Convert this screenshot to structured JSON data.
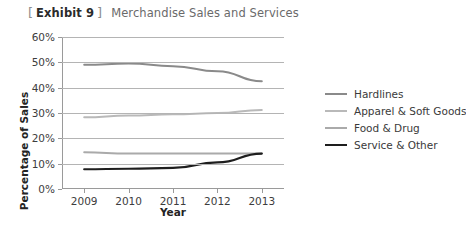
{
  "header": {
    "bracket_open": "[",
    "bracket_close": "]",
    "exhibit_label": "Exhibit 9",
    "title": "Merchandise Sales and Services"
  },
  "chart_data": {
    "type": "line",
    "title": "Merchandise Sales and Services",
    "xlabel": "Year",
    "ylabel": "Percentage of Sales",
    "categories": [
      "2009",
      "2010",
      "2011",
      "2012",
      "2013"
    ],
    "x": [
      2009,
      2010,
      2011,
      2012,
      2013
    ],
    "ylim": [
      0,
      60
    ],
    "yticks": [
      "0%",
      "10%",
      "20%",
      "30%",
      "40%",
      "50%",
      "60%"
    ],
    "ytick_values": [
      0,
      10,
      20,
      30,
      40,
      50,
      60
    ],
    "grid": true,
    "legend_position": "right",
    "series": [
      {
        "name": "Hardlines",
        "color": "#8a8a8a",
        "width": 2.0,
        "values": [
          49.0,
          49.5,
          48.5,
          46.5,
          42.5
        ]
      },
      {
        "name": "Apparel & Soft Goods",
        "color": "#b9b9b9",
        "width": 2.0,
        "values": [
          28.3,
          29.0,
          29.5,
          30.0,
          31.2
        ]
      },
      {
        "name": "Food & Drug",
        "color": "#aaaaaa",
        "width": 2.0,
        "values": [
          14.5,
          14.0,
          14.0,
          14.0,
          14.0
        ]
      },
      {
        "name": "Service & Other",
        "color": "#1e1e1e",
        "width": 2.2,
        "values": [
          7.8,
          8.0,
          8.3,
          10.5,
          14.0
        ]
      }
    ]
  },
  "legend": {
    "items": [
      {
        "label": "Hardlines",
        "color": "#8a8a8a",
        "width": "2px"
      },
      {
        "label": "Apparel & Soft Goods",
        "color": "#b9b9b9",
        "width": "2px"
      },
      {
        "label": "Food & Drug",
        "color": "#aaaaaa",
        "width": "2px"
      },
      {
        "label": "Service & Other",
        "color": "#1e1e1e",
        "width": "2.5px"
      }
    ]
  },
  "colors": {
    "gridline": "#b4b4b4",
    "axis": "#9a9a9a",
    "text": "#3d3d3d",
    "title_text": "#6a6a6a"
  }
}
